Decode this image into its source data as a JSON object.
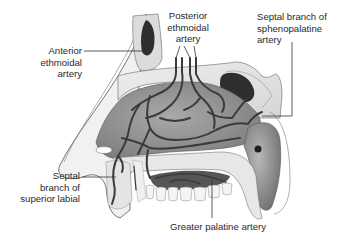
{
  "figure": {
    "colors": {
      "background": "#ffffff",
      "artery": "#3a3a3a",
      "mucosa": "#8f8f8f",
      "bone": "#e6e6e6",
      "sinus": "#2e2e2e",
      "leader_line": "#333333",
      "label_text": "#2a2a2a"
    }
  },
  "labels": {
    "anterior_ethmoidal": {
      "line1": "Anterior",
      "line2": "ethmoidal",
      "line3": "artery"
    },
    "posterior_ethmoidal": {
      "line1": "Posterior",
      "line2": "ethmoidal",
      "line3": "artery"
    },
    "sphenopalatine": {
      "line1": "Septal branch of",
      "line2": "sphenopalatine",
      "line3": "artery"
    },
    "superior_labial": {
      "line1": "Septal",
      "line2": "branch of",
      "line3": "superior labial"
    },
    "greater_palatine": {
      "line1": "Greater palatine artery"
    }
  }
}
